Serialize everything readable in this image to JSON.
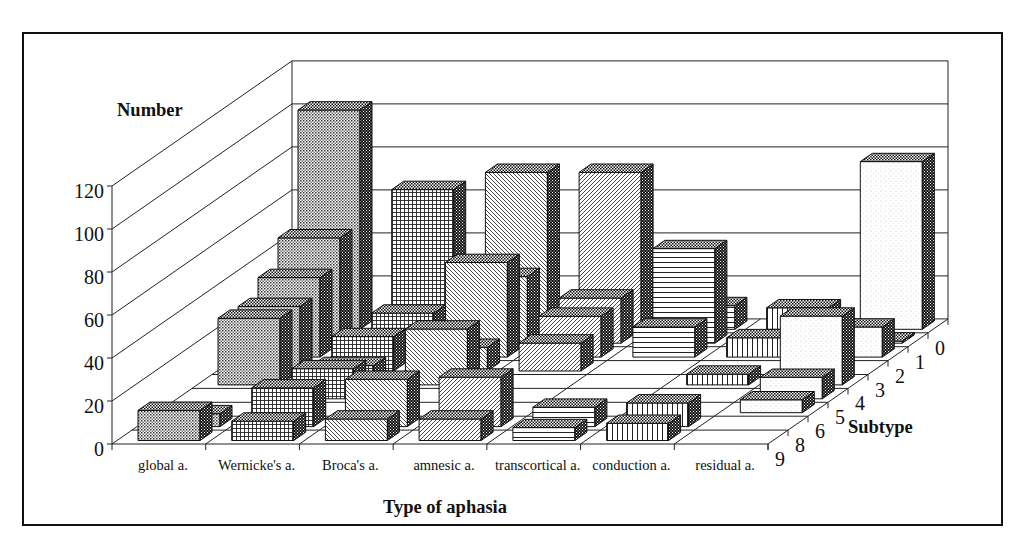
{
  "chart_data": {
    "type": "bar",
    "projection": "3d",
    "title": "",
    "xlabel": "Type of aphasia",
    "ylabel": "Number",
    "zlabel": "Subtype",
    "categories": [
      "global a.",
      "Wernicke's a.",
      "Broca's a.",
      "amnesic a.",
      "transcortical a.",
      "conduction a.",
      "residual a."
    ],
    "depth_categories": [
      "9",
      "8",
      "6",
      "5",
      "4",
      "3",
      "2",
      "1",
      "0"
    ],
    "yticks": [
      0,
      20,
      40,
      60,
      80,
      100,
      120
    ],
    "ylim": [
      0,
      120
    ],
    "grid": true,
    "legend": null,
    "category_fills": [
      "dots",
      "grid",
      "diag-back",
      "diag-fwd",
      "horizontal",
      "vertical",
      "light"
    ],
    "series": [
      {
        "name": "0",
        "values": [
          102,
          65,
          73,
          73,
          11,
          10,
          78
        ]
      },
      {
        "name": "1",
        "values": [
          49,
          14,
          31,
          21,
          44,
          0,
          1
        ]
      },
      {
        "name": "2",
        "values": [
          37,
          0,
          44,
          19,
          14,
          9,
          14
        ]
      },
      {
        "name": "3",
        "values": [
          30,
          16,
          11,
          13,
          0,
          0,
          0
        ]
      },
      {
        "name": "4",
        "values": [
          31,
          9,
          26,
          0,
          0,
          5,
          32
        ]
      },
      {
        "name": "5",
        "values": [
          0,
          14,
          0,
          0,
          0,
          0,
          10
        ]
      },
      {
        "name": "6",
        "values": [
          0,
          0,
          0,
          0,
          0,
          0,
          6
        ]
      },
      {
        "name": "8",
        "values": [
          6,
          18,
          22,
          23,
          9,
          11,
          0
        ]
      },
      {
        "name": "9",
        "values": [
          14,
          9,
          10,
          10,
          6,
          8,
          0
        ]
      }
    ]
  }
}
